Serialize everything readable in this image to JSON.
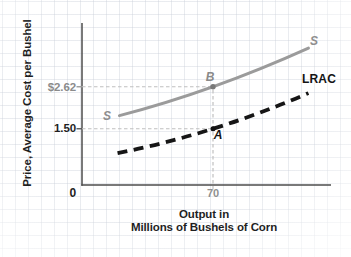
{
  "chart_data": {
    "type": "line",
    "title": "",
    "ylabel": "Price, Average Cost per Bushel",
    "xlabel": "Output in Millions of Bushels of Corn",
    "xlabel_lines": [
      "Output in",
      "Millions of Bushels of Corn"
    ],
    "x_axis": {
      "origin_label": "0",
      "ticks": [
        {
          "value": 70,
          "label": "70"
        }
      ]
    },
    "y_axis": {
      "ticks": [
        {
          "value": 2.62,
          "label": "$2.62"
        },
        {
          "value": 1.5,
          "label": "1.50"
        }
      ]
    },
    "series": [
      {
        "name": "S",
        "description": "short-run supply curve",
        "style": "solid",
        "color": "#9b9b9b",
        "label_start": "S",
        "label_end": "S",
        "points": [
          [
            20,
            1.85
          ],
          [
            70,
            2.62
          ],
          [
            121,
            3.65
          ]
        ]
      },
      {
        "name": "LRAC",
        "description": "long-run average cost curve",
        "style": "dashed",
        "color": "#161616",
        "label": "LRAC",
        "points": [
          [
            19,
            0.85
          ],
          [
            70,
            1.5
          ],
          [
            121,
            2.45
          ]
        ]
      }
    ],
    "points": [
      {
        "label": "B",
        "x": 70,
        "y": 2.62,
        "on": "S",
        "color": "#787878"
      },
      {
        "label": "A",
        "x": 70,
        "y": 1.5,
        "on": "LRAC",
        "color": "#111111"
      }
    ],
    "axis_color": "#4d4d4d",
    "guide_color": "#c0c0c0",
    "grid": "faint graph paper",
    "legend_position": "none"
  }
}
